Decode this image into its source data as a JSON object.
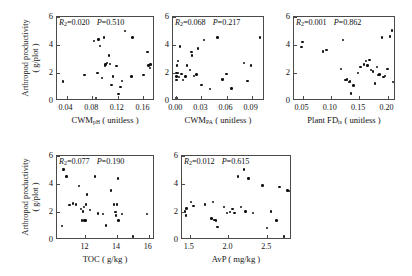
{
  "figure": {
    "y_axis_label_line1": "Arthropod productivity",
    "y_axis_label_line2": "( g/plot )",
    "y_ticks": [
      "0",
      "2",
      "4",
      "6"
    ],
    "y_tick_values": [
      0,
      2,
      4,
      6
    ],
    "y_lim": [
      0,
      6
    ]
  },
  "chart_data": [
    {
      "type": "scatter",
      "panel": 1,
      "title": "",
      "xlabel": "CWM",
      "xlabel_sub": "pH",
      "xlabel_unit": "( unitless )",
      "ylabel": "Arthropod productivity ( g/plot )",
      "xlim": [
        0.025,
        0.178
      ],
      "ylim": [
        0,
        6
      ],
      "xticks": [
        0.04,
        0.08,
        0.12,
        0.16
      ],
      "xtick_labels": [
        "0.04",
        "0.08",
        "0.12",
        "0.16"
      ],
      "yticks": [
        0,
        2,
        4,
        6
      ],
      "ytick_labels": [
        "0",
        "2",
        "4",
        "6"
      ],
      "grid": false,
      "r2_label": "R",
      "r2_sub": "2",
      "r2_value": "0.020",
      "p_label": "P",
      "p_value": "0.510",
      "annotation": "R2=0.020  P=0.510",
      "x": [
        0.034,
        0.068,
        0.083,
        0.086,
        0.088,
        0.09,
        0.092,
        0.095,
        0.098,
        0.1,
        0.101,
        0.103,
        0.106,
        0.108,
        0.11,
        0.112,
        0.118,
        0.121,
        0.124,
        0.126,
        0.131,
        0.141,
        0.143,
        0.16,
        0.166,
        0.168,
        0.17,
        0.171
      ],
      "y": [
        1.4,
        1.85,
        4.3,
        0.2,
        2.0,
        4.4,
        3.95,
        1.65,
        4.55,
        2.55,
        2.6,
        2.7,
        3.25,
        2.65,
        1.15,
        1.75,
        2.5,
        0.5,
        1.0,
        1.45,
        5.0,
        1.75,
        4.55,
        1.85,
        3.5,
        2.55,
        2.35,
        2.6
      ]
    },
    {
      "type": "scatter",
      "panel": 2,
      "title": "",
      "xlabel": "CWM",
      "xlabel_sub": "PA",
      "xlabel_unit": "( unitless )",
      "ylabel": "Arthropod productivity ( g/plot )",
      "xlim": [
        -0.004,
        0.106
      ],
      "ylim": [
        0,
        6
      ],
      "xticks": [
        0.0,
        0.03,
        0.06,
        0.09
      ],
      "xtick_labels": [
        "0.00",
        "0.03",
        "0.06",
        "0.09"
      ],
      "yticks": [
        0,
        2,
        4,
        6
      ],
      "ytick_labels": [
        "0",
        "2",
        "4",
        "6"
      ],
      "grid": false,
      "r2_label": "R",
      "r2_sub": "2",
      "r2_value": "0.068",
      "p_label": "P",
      "p_value": "0.217",
      "annotation": "R2=0.068  P=0.217",
      "x": [
        0.0,
        0.0,
        0.0,
        0.0,
        0.001,
        0.002,
        0.002,
        0.003,
        0.004,
        0.006,
        0.008,
        0.011,
        0.013,
        0.016,
        0.018,
        0.019,
        0.021,
        0.024,
        0.026,
        0.03,
        0.033,
        0.04,
        0.049,
        0.055,
        0.06,
        0.066,
        0.081,
        0.085,
        0.089,
        0.1
      ],
      "y": [
        0.2,
        1.5,
        1.75,
        2.0,
        2.55,
        2.0,
        2.85,
        1.7,
        3.9,
        1.95,
        1.5,
        1.75,
        2.55,
        2.2,
        3.5,
        3.25,
        1.8,
        1.9,
        3.75,
        1.15,
        4.35,
        0.85,
        4.55,
        1.55,
        1.95,
        0.9,
        2.7,
        1.45,
        2.55,
        4.55
      ]
    },
    {
      "type": "scatter",
      "panel": 3,
      "title": "",
      "xlabel": "Plant FD",
      "xlabel_sub": "is",
      "xlabel_unit": "( unitless )",
      "ylabel": "Arthropod productivity ( g/plot )",
      "xlim": [
        0.035,
        0.215
      ],
      "ylim": [
        0,
        6
      ],
      "xticks": [
        0.05,
        0.1,
        0.15,
        0.2
      ],
      "xtick_labels": [
        "0.05",
        "0.10",
        "0.15",
        "0.20"
      ],
      "yticks": [
        0,
        2,
        4,
        6
      ],
      "ytick_labels": [
        "0",
        "2",
        "4",
        "6"
      ],
      "grid": false,
      "r2_label": "R",
      "r2_sub": "2",
      "r2_value": "0.001",
      "p_label": "P",
      "p_value": "0.862",
      "annotation": "R2=0.001  P=0.862",
      "x": [
        0.048,
        0.05,
        0.086,
        0.092,
        0.118,
        0.121,
        0.126,
        0.129,
        0.132,
        0.134,
        0.136,
        0.14,
        0.148,
        0.152,
        0.158,
        0.162,
        0.165,
        0.168,
        0.171,
        0.174,
        0.178,
        0.181,
        0.184,
        0.186,
        0.19,
        0.193,
        0.196,
        0.2,
        0.204,
        0.208,
        0.21
      ],
      "y": [
        3.85,
        4.2,
        3.55,
        3.65,
        2.3,
        4.35,
        1.5,
        1.55,
        1.35,
        1.4,
        0.55,
        1.1,
        2.0,
        2.45,
        2.6,
        2.85,
        2.55,
        2.95,
        2.2,
        2.1,
        1.25,
        2.45,
        1.85,
        1.9,
        4.55,
        1.7,
        1.8,
        2.3,
        4.6,
        5.05,
        1.35
      ]
    },
    {
      "type": "scatter",
      "panel": 4,
      "title": "",
      "xlabel": "TOC",
      "xlabel_sub": "",
      "xlabel_unit": "( g/kg )",
      "ylabel": "Arthropod productivity ( g/plot )",
      "xlim": [
        10.2,
        16.4
      ],
      "ylim": [
        0,
        6
      ],
      "xticks": [
        12,
        14,
        16
      ],
      "xtick_labels": [
        "12",
        "14",
        "16"
      ],
      "yticks": [
        0,
        2,
        4,
        6
      ],
      "ytick_labels": [
        "0",
        "2",
        "4",
        "6"
      ],
      "grid": false,
      "r2_label": "R",
      "r2_sub": "2",
      "r2_value": "0.077",
      "p_label": "P",
      "p_value": "0.190",
      "annotation": "R2=0.077  P=0.190",
      "x": [
        10.5,
        10.6,
        10.8,
        11.0,
        11.2,
        11.4,
        11.6,
        11.7,
        11.8,
        11.85,
        11.9,
        11.95,
        12.0,
        12.05,
        12.1,
        12.3,
        12.6,
        12.8,
        13.1,
        13.3,
        13.6,
        13.8,
        13.9,
        13.95,
        14.0,
        14.05,
        14.1,
        14.3,
        15.0,
        15.9
      ],
      "y": [
        1.0,
        5.05,
        4.55,
        2.5,
        2.6,
        2.55,
        3.85,
        2.2,
        1.4,
        2.05,
        2.35,
        1.4,
        1.4,
        2.55,
        3.25,
        2.15,
        4.55,
        1.9,
        1.85,
        1.05,
        3.55,
        2.55,
        2.0,
        1.75,
        2.55,
        4.4,
        1.4,
        1.85,
        0.25,
        1.85
      ]
    },
    {
      "type": "scatter",
      "panel": 5,
      "title": "",
      "xlabel": "AvP",
      "xlabel_sub": "",
      "xlabel_unit": "( mg/kg )",
      "ylabel": "Arthropod productivity ( g/plot )",
      "xlim": [
        1.4,
        2.82
      ],
      "ylim": [
        0,
        6
      ],
      "xticks": [
        1.5,
        2.0,
        2.5
      ],
      "xtick_labels": [
        "1.5",
        "2.0",
        "2.5"
      ],
      "yticks": [
        0,
        2,
        4,
        6
      ],
      "ytick_labels": [
        "0",
        "2",
        "4",
        "6"
      ],
      "grid": false,
      "r2_label": "R",
      "r2_sub": "2",
      "r2_value": "0.012",
      "p_label": "P",
      "p_value": "0.615",
      "annotation": "R2=0.012  P=0.615",
      "x": [
        1.44,
        1.45,
        1.46,
        1.52,
        1.55,
        1.7,
        1.78,
        1.8,
        1.82,
        1.84,
        1.86,
        1.94,
        1.98,
        2.02,
        2.05,
        2.08,
        2.12,
        2.16,
        2.2,
        2.22,
        2.26,
        2.32,
        2.44,
        2.5,
        2.55,
        2.62,
        2.66,
        2.72,
        2.76,
        2.78
      ],
      "y": [
        2.05,
        1.75,
        2.25,
        2.7,
        2.45,
        2.55,
        1.55,
        2.7,
        1.45,
        1.4,
        0.95,
        2.35,
        1.95,
        2.0,
        2.2,
        1.95,
        4.55,
        2.35,
        5.05,
        2.05,
        4.4,
        1.95,
        3.9,
        0.85,
        2.05,
        1.4,
        3.8,
        0.25,
        3.55,
        3.5
      ]
    }
  ]
}
